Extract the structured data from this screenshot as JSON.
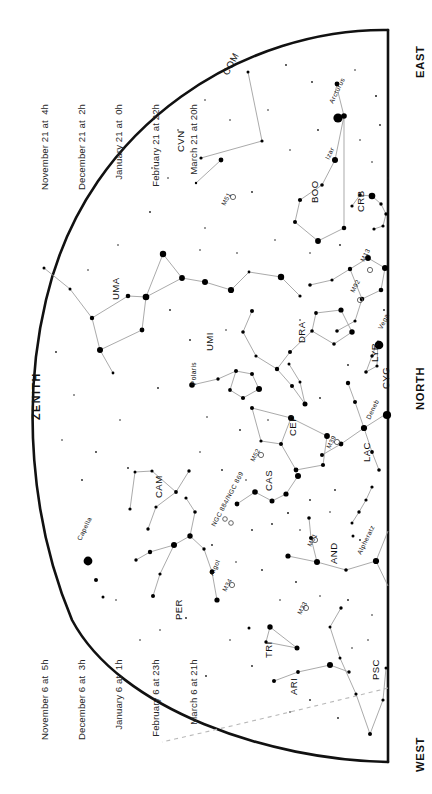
{
  "page": {
    "background": "#ffffff",
    "ink": "#000000",
    "line_color": "#999999",
    "width": 432,
    "height": 794
  },
  "date_blocks": [
    {
      "name": "date-block-upper",
      "lines": [
        "November 21 at  4h",
        "December 21 at  2h",
        "January 21 at  0h",
        "February 21 at 22h",
        "March 21 at 20h"
      ]
    },
    {
      "name": "date-block-lower",
      "lines": [
        "November 6 at  5h",
        "December 6 at  3h",
        "January 6 at  1h",
        "February 6 at 23h",
        "March 6 at 21h"
      ]
    }
  ],
  "cardinals": {
    "east": "EAST",
    "north": "NORTH",
    "west": "WEST",
    "zenith": "ZENITH"
  },
  "chart_data": {
    "type": "scatter",
    "xlabel": "",
    "ylabel": "",
    "projection": "half-dome horizon map, straight meridian at right edge",
    "grid": false,
    "legend": false,
    "constellations": [
      {
        "abbr": "COM",
        "label_x": 228,
        "label_y": 76,
        "rot": -62
      },
      {
        "abbr": "CVN",
        "label_x": 184,
        "label_y": 152,
        "rot": -90
      },
      {
        "abbr": "UMA",
        "label_x": 119,
        "label_y": 300,
        "rot": -90
      },
      {
        "abbr": "UMI",
        "label_x": 213,
        "label_y": 351,
        "rot": -90
      },
      {
        "abbr": "BOO",
        "label_x": 318,
        "label_y": 203,
        "rot": -90
      },
      {
        "abbr": "CRB",
        "label_x": 364,
        "label_y": 212,
        "rot": -90
      },
      {
        "abbr": "DRA",
        "label_x": 305,
        "label_y": 343,
        "rot": -90
      },
      {
        "abbr": "LYR",
        "label_x": 378,
        "label_y": 362,
        "rot": -90
      },
      {
        "abbr": "CYG",
        "label_x": 389,
        "label_y": 389,
        "rot": -90
      },
      {
        "abbr": "CEP",
        "label_x": 296,
        "label_y": 436,
        "rot": -90
      },
      {
        "abbr": "LAC",
        "label_x": 370,
        "label_y": 462,
        "rot": -90
      },
      {
        "abbr": "CAS",
        "label_x": 272,
        "label_y": 491,
        "rot": -90
      },
      {
        "abbr": "CAM",
        "label_x": 162,
        "label_y": 498,
        "rot": -90
      },
      {
        "abbr": "AND",
        "label_x": 337,
        "label_y": 564,
        "rot": -90
      },
      {
        "abbr": "PER",
        "label_x": 182,
        "label_y": 620,
        "rot": -90
      },
      {
        "abbr": "TRI",
        "label_x": 272,
        "label_y": 658,
        "rot": -90
      },
      {
        "abbr": "ARI",
        "label_x": 297,
        "label_y": 695,
        "rot": -90
      },
      {
        "abbr": "PSC",
        "label_x": 379,
        "label_y": 680,
        "rot": -90
      }
    ],
    "stars_named": [
      {
        "name": "Arcturus",
        "label_x": 333,
        "label_y": 104,
        "rot": -64
      },
      {
        "name": "Izar",
        "label_x": 329,
        "label_y": 160,
        "rot": -64
      },
      {
        "name": "Vega",
        "label_x": 382,
        "label_y": 330,
        "rot": -64
      },
      {
        "name": "Deneb",
        "label_x": 370,
        "label_y": 420,
        "rot": -64
      },
      {
        "name": "Polaris",
        "label_x": 196,
        "label_y": 385,
        "rot": -90
      },
      {
        "name": "Capella",
        "label_x": 81,
        "label_y": 541,
        "rot": -64
      },
      {
        "name": "Algol",
        "label_x": 213,
        "label_y": 576,
        "rot": -64
      },
      {
        "name": "Alpheratz",
        "label_x": 361,
        "label_y": 555,
        "rot": -64
      }
    ],
    "deep_sky": [
      {
        "name": "M51",
        "label_x": 225,
        "label_y": 206,
        "rot": -62
      },
      {
        "name": "M13",
        "label_x": 364,
        "label_y": 262,
        "rot": -62
      },
      {
        "name": "M92",
        "label_x": 354,
        "label_y": 293,
        "rot": -62
      },
      {
        "name": "M39",
        "label_x": 330,
        "label_y": 449,
        "rot": -62
      },
      {
        "name": "M52",
        "label_x": 254,
        "label_y": 462,
        "rot": -62
      },
      {
        "name": "NGC 884/NGC 869",
        "label_x": 215,
        "label_y": 527,
        "rot": -62
      },
      {
        "name": "M34",
        "label_x": 226,
        "label_y": 592,
        "rot": -62
      },
      {
        "name": "M31",
        "label_x": 311,
        "label_y": 547,
        "rot": -62
      },
      {
        "name": "M33",
        "label_x": 301,
        "label_y": 615,
        "rot": -62
      }
    ]
  }
}
